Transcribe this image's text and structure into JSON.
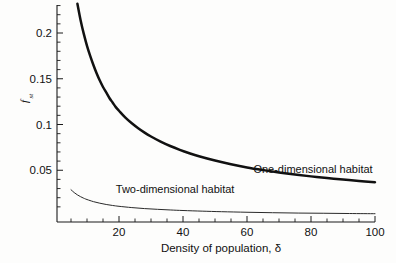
{
  "chart_data": {
    "type": "line",
    "title": "",
    "xlabel": "Density of population, δ",
    "ylabel": "f",
    "ylabel_sub": "st",
    "xlim": [
      0,
      102
    ],
    "ylim": [
      0,
      0.235
    ],
    "grid": false,
    "legend_position": "inline-annotations",
    "xticks": [
      20,
      40,
      60,
      80,
      100
    ],
    "xtick_labels": [
      "20",
      "40",
      "60",
      "80",
      "100"
    ],
    "xticks_minor_step": 5,
    "yticks": [
      0.05,
      0.1,
      0.15,
      0.2
    ],
    "ytick_labels": [
      "0.05",
      "0.1",
      "0.15",
      "0.2"
    ],
    "yticks_minor_step": 0.01,
    "series": [
      {
        "name": "One-dimensional habitat",
        "style": "bold",
        "annotation": "One-dimensional habitat",
        "x": [
          7,
          8,
          9,
          10,
          11,
          12,
          13,
          14,
          15,
          16,
          17,
          18,
          19,
          20,
          22,
          24,
          26,
          28,
          30,
          33,
          36,
          39,
          42,
          45,
          50,
          55,
          60,
          65,
          70,
          75,
          80,
          85,
          90,
          95,
          100
        ],
        "y": [
          0.232,
          0.214,
          0.199,
          0.186,
          0.175,
          0.165,
          0.156,
          0.148,
          0.141,
          0.135,
          0.129,
          0.124,
          0.119,
          0.115,
          0.1075,
          0.1013,
          0.0959,
          0.0911,
          0.0869,
          0.0813,
          0.0765,
          0.0723,
          0.0686,
          0.0653,
          0.0606,
          0.0566,
          0.0531,
          0.0502,
          0.0476,
          0.0453,
          0.0433,
          0.0415,
          0.0398,
          0.0383,
          0.037
        ]
      },
      {
        "name": "Two-dimensional habitat",
        "style": "thin",
        "annotation": "Two-dimensional habitat",
        "x": [
          5,
          6,
          7,
          8,
          9,
          10,
          12,
          14,
          16,
          18,
          20,
          24,
          28,
          32,
          36,
          40,
          46,
          52,
          60,
          68,
          76,
          84,
          92,
          100
        ],
        "y": [
          0.0287,
          0.0256,
          0.0231,
          0.0211,
          0.0194,
          0.018,
          0.0157,
          0.014,
          0.0126,
          0.0115,
          0.0106,
          0.0092,
          0.0081,
          0.0073,
          0.0066,
          0.006,
          0.0053,
          0.0047,
          0.0041,
          0.0036,
          0.0032,
          0.003,
          0.0027,
          0.0025
        ]
      }
    ],
    "annotations": [
      {
        "text": "One-dimensional habitat",
        "x": 62,
        "y": 0.047
      },
      {
        "text": "Two-dimensional habitat",
        "x": 19,
        "y": 0.0255
      }
    ],
    "colors": {
      "curve_primary": "#111111",
      "curve_secondary": "#2a2a2a",
      "axis": "#1a1a1a",
      "background": "#fdfdfc"
    }
  }
}
